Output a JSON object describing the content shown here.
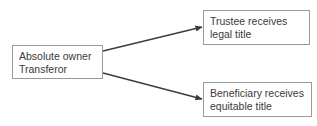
{
  "diagram": {
    "nodes": [
      {
        "id": "source",
        "lines": [
          "Absolute owner",
          "Transferor"
        ]
      },
      {
        "id": "trustee",
        "lines": [
          "Trustee receives",
          "legal title"
        ]
      },
      {
        "id": "beneficiary",
        "lines": [
          "Beneficiary receives",
          "equitable title"
        ]
      }
    ],
    "edges": [
      {
        "from": "source",
        "to": "trustee"
      },
      {
        "from": "source",
        "to": "beneficiary"
      }
    ],
    "colors": {
      "border": "#9a9a9a",
      "arrow": "#3c3c3c",
      "text": "#3a3a3a",
      "background": "#ffffff"
    }
  }
}
